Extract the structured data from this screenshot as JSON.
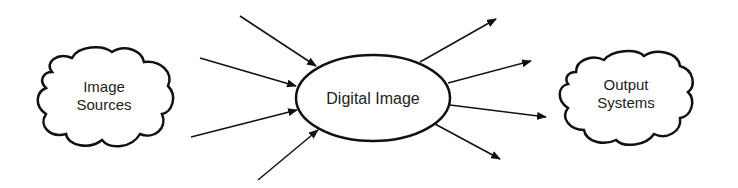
{
  "diagram": {
    "colors": {
      "stroke": "#111111",
      "text": "#222222",
      "background": "#ffffff"
    },
    "nodes": {
      "source": {
        "lines": [
          "Image",
          "Sources"
        ],
        "shape": "cloud"
      },
      "center": {
        "label": "Digital Image",
        "shape": "ellipse"
      },
      "output": {
        "lines": [
          "Output",
          "Systems"
        ],
        "shape": "cloud"
      }
    },
    "incoming_arrows": [
      {
        "x1": 240,
        "y1": 16,
        "x2": 316,
        "y2": 66
      },
      {
        "x1": 200,
        "y1": 58,
        "x2": 296,
        "y2": 86
      },
      {
        "x1": 191,
        "y1": 137,
        "x2": 297,
        "y2": 110
      },
      {
        "x1": 258,
        "y1": 180,
        "x2": 318,
        "y2": 130
      }
    ],
    "outgoing_arrows": [
      {
        "x1": 420,
        "y1": 62,
        "x2": 496,
        "y2": 19
      },
      {
        "x1": 448,
        "y1": 83,
        "x2": 531,
        "y2": 61
      },
      {
        "x1": 450,
        "y1": 105,
        "x2": 546,
        "y2": 117
      },
      {
        "x1": 435,
        "y1": 124,
        "x2": 500,
        "y2": 159
      }
    ]
  }
}
